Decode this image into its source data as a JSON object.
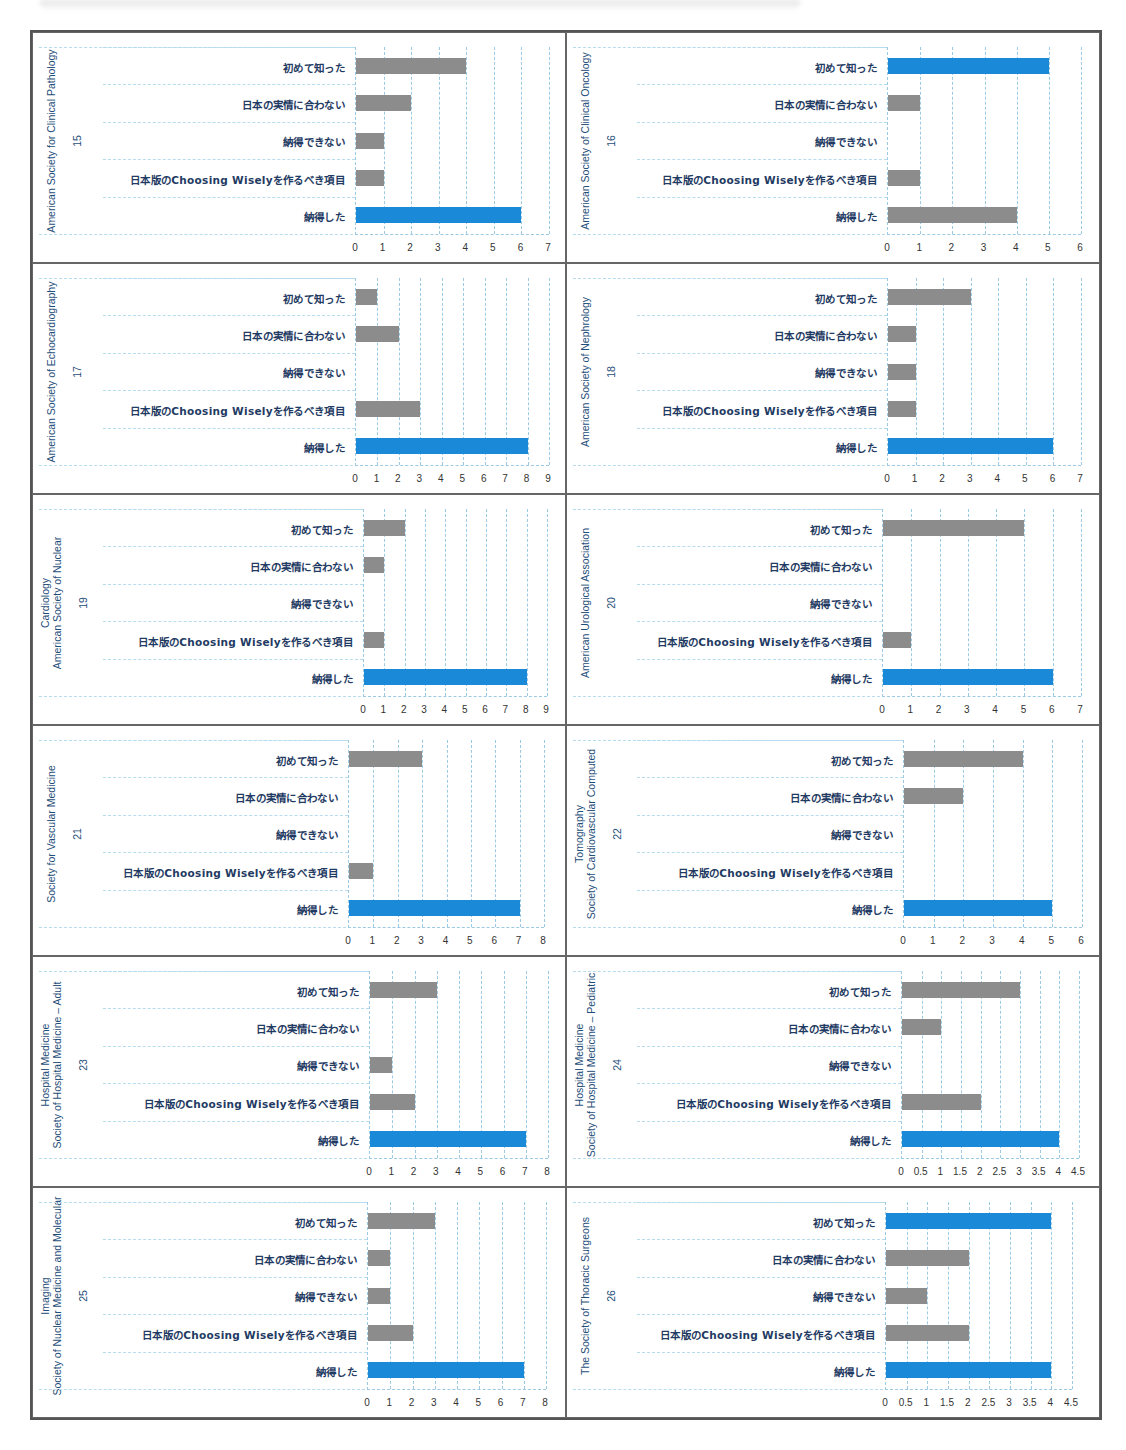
{
  "colors": {
    "highlight_bar": "#1a8ad8",
    "normal_bar": "#8c8c8c",
    "label_text": "#1f3b63",
    "axis_title": "#1f4e79",
    "grid": "#9cc9e3"
  },
  "categories": [
    "初めて知った",
    "日本の実情に合わない",
    "納得できない",
    "日本版のChoosing Wiselyを作るべき項目",
    "納得した"
  ],
  "chart_data": [
    {
      "type": "bar",
      "orientation": "horizontal",
      "number": "15",
      "title": "American Society for Clinical Pathology",
      "categories": [
        "初めて知った",
        "日本の実情に合わない",
        "納得できない",
        "日本版のChoosing Wiselyを作るべき項目",
        "納得した"
      ],
      "values": [
        4,
        2,
        1,
        1,
        6
      ],
      "highlight": [
        false,
        false,
        false,
        false,
        true
      ],
      "xlim": [
        0,
        7
      ],
      "ticks": [
        "0",
        "1",
        "2",
        "3",
        "4",
        "5",
        "6",
        "7"
      ],
      "grid": true
    },
    {
      "type": "bar",
      "orientation": "horizontal",
      "number": "16",
      "title": "American Society of Clinical Oncology",
      "categories": [
        "初めて知った",
        "日本の実情に合わない",
        "納得できない",
        "日本版のChoosing Wiselyを作るべき項目",
        "納得した"
      ],
      "values": [
        5,
        1,
        0,
        1,
        4
      ],
      "highlight": [
        true,
        false,
        false,
        false,
        false
      ],
      "xlim": [
        0,
        6
      ],
      "ticks": [
        "0",
        "1",
        "2",
        "3",
        "4",
        "5",
        "6"
      ],
      "grid": true
    },
    {
      "type": "bar",
      "orientation": "horizontal",
      "number": "17",
      "title": "American Society of Echocardiography",
      "categories": [
        "初めて知った",
        "日本の実情に合わない",
        "納得できない",
        "日本版のChoosing Wiselyを作るべき項目",
        "納得した"
      ],
      "values": [
        1,
        2,
        0,
        3,
        8
      ],
      "highlight": [
        false,
        false,
        false,
        false,
        true
      ],
      "xlim": [
        0,
        9
      ],
      "ticks": [
        "0",
        "1",
        "2",
        "3",
        "4",
        "5",
        "6",
        "7",
        "8",
        "9"
      ],
      "grid": true
    },
    {
      "type": "bar",
      "orientation": "horizontal",
      "number": "18",
      "title": "American Society of Nephrology",
      "categories": [
        "初めて知った",
        "日本の実情に合わない",
        "納得できない",
        "日本版のChoosing Wiselyを作るべき項目",
        "納得した"
      ],
      "values": [
        3,
        1,
        1,
        1,
        6
      ],
      "highlight": [
        false,
        false,
        false,
        false,
        true
      ],
      "xlim": [
        0,
        7
      ],
      "ticks": [
        "0",
        "1",
        "2",
        "3",
        "4",
        "5",
        "6",
        "7"
      ],
      "grid": true
    },
    {
      "type": "bar",
      "orientation": "horizontal",
      "number": "19",
      "title": "American Society of Nuclear Cardiology",
      "title_lines": [
        "American Society of Nuclear",
        "Cardiology"
      ],
      "categories": [
        "初めて知った",
        "日本の実情に合わない",
        "納得できない",
        "日本版のChoosing Wiselyを作るべき項目",
        "納得した"
      ],
      "values": [
        2,
        1,
        0,
        1,
        8
      ],
      "highlight": [
        false,
        false,
        false,
        false,
        true
      ],
      "xlim": [
        0,
        9
      ],
      "ticks": [
        "0",
        "1",
        "2",
        "3",
        "4",
        "5",
        "6",
        "7",
        "8",
        "9"
      ],
      "grid": true
    },
    {
      "type": "bar",
      "orientation": "horizontal",
      "number": "20",
      "title": "American Urological Association",
      "categories": [
        "初めて知った",
        "日本の実情に合わない",
        "納得できない",
        "日本版のChoosing Wiselyを作るべき項目",
        "納得した"
      ],
      "values": [
        5,
        0,
        0,
        1,
        6
      ],
      "highlight": [
        false,
        false,
        false,
        false,
        true
      ],
      "xlim": [
        0,
        7
      ],
      "ticks": [
        "0",
        "1",
        "2",
        "3",
        "4",
        "5",
        "6",
        "7"
      ],
      "grid": true
    },
    {
      "type": "bar",
      "orientation": "horizontal",
      "number": "21",
      "title": "Society for Vascular Medicine",
      "categories": [
        "初めて知った",
        "日本の実情に合わない",
        "納得できない",
        "日本版のChoosing Wiselyを作るべき項目",
        "納得した"
      ],
      "values": [
        3,
        0,
        0,
        1,
        7
      ],
      "highlight": [
        false,
        false,
        false,
        false,
        true
      ],
      "xlim": [
        0,
        8
      ],
      "ticks": [
        "0",
        "1",
        "2",
        "3",
        "4",
        "5",
        "6",
        "7",
        "8"
      ],
      "grid": true
    },
    {
      "type": "bar",
      "orientation": "horizontal",
      "number": "22",
      "title": "Society of Cardiovascular Computed Tomography",
      "title_lines": [
        "Society of Cardiovascular Computed",
        "Tomography"
      ],
      "categories": [
        "初めて知った",
        "日本の実情に合わない",
        "納得できない",
        "日本版のChoosing Wiselyを作るべき項目",
        "納得した"
      ],
      "values": [
        4,
        2,
        0,
        0,
        5
      ],
      "highlight": [
        false,
        false,
        false,
        false,
        true
      ],
      "xlim": [
        0,
        6
      ],
      "ticks": [
        "0",
        "1",
        "2",
        "3",
        "4",
        "5",
        "6"
      ],
      "grid": true
    },
    {
      "type": "bar",
      "orientation": "horizontal",
      "number": "23",
      "title": "Society of Hospital Medicine – Adult Hospital Medicine",
      "title_lines": [
        "Society of Hospital Medicine – Adult",
        "Hospital Medicine"
      ],
      "categories": [
        "初めて知った",
        "日本の実情に合わない",
        "納得できない",
        "日本版のChoosing Wiselyを作るべき項目",
        "納得した"
      ],
      "values": [
        3,
        0,
        1,
        2,
        7
      ],
      "highlight": [
        false,
        false,
        false,
        false,
        true
      ],
      "xlim": [
        0,
        8
      ],
      "ticks": [
        "0",
        "1",
        "2",
        "3",
        "4",
        "5",
        "6",
        "7",
        "8"
      ],
      "grid": true
    },
    {
      "type": "bar",
      "orientation": "horizontal",
      "number": "24",
      "title": "Society of Hospital Medicine – Pediatric Hospital Medicine",
      "title_lines": [
        "Society of Hospital Medicine – Pediatric",
        "Hospital Medicine"
      ],
      "categories": [
        "初めて知った",
        "日本の実情に合わない",
        "納得できない",
        "日本版のChoosing Wiselyを作るべき項目",
        "納得した"
      ],
      "values": [
        3,
        1,
        0,
        2,
        4
      ],
      "highlight": [
        false,
        false,
        false,
        false,
        true
      ],
      "xlim": [
        0,
        4.5
      ],
      "ticks": [
        "0",
        "0.5",
        "1",
        "1.5",
        "2",
        "2.5",
        "3",
        "3.5",
        "4",
        "4.5"
      ],
      "grid": true
    },
    {
      "type": "bar",
      "orientation": "horizontal",
      "number": "25",
      "title": "Society of Nuclear Medicine and Molecular Imaging",
      "title_lines": [
        "Society of Nuclear Medicine and Molecular",
        "Imaging"
      ],
      "categories": [
        "初めて知った",
        "日本の実情に合わない",
        "納得できない",
        "日本版のChoosing Wiselyを作るべき項目",
        "納得した"
      ],
      "values": [
        3,
        1,
        1,
        2,
        7
      ],
      "highlight": [
        false,
        false,
        false,
        false,
        true
      ],
      "xlim": [
        0,
        8
      ],
      "ticks": [
        "0",
        "1",
        "2",
        "3",
        "4",
        "5",
        "6",
        "7",
        "8"
      ],
      "grid": true
    },
    {
      "type": "bar",
      "orientation": "horizontal",
      "number": "26",
      "title": "The Society of Thoracic Surgeons",
      "categories": [
        "初めて知った",
        "日本の実情に合わない",
        "納得できない",
        "日本版のChoosing Wiselyを作るべき項目",
        "納得した"
      ],
      "values": [
        4,
        2,
        1,
        2,
        4
      ],
      "highlight": [
        true,
        false,
        false,
        false,
        true
      ],
      "xlim": [
        0,
        4.5
      ],
      "ticks": [
        "0",
        "0.5",
        "1",
        "1.5",
        "2",
        "2.5",
        "3",
        "3.5",
        "4",
        "4.5"
      ],
      "grid": true
    }
  ]
}
